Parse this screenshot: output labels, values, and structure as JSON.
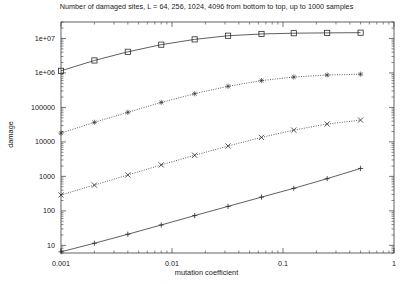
{
  "chart_data": {
    "type": "line",
    "title": "Number of damaged sites, L = 64, 256, 1024, 4096 from bottom to top, up to 1000 samples",
    "xlabel": "mutation coefficient",
    "ylabel": "damage",
    "xscale": "log",
    "yscale": "log",
    "xlim": [
      0.001,
      1.0
    ],
    "ylim": [
      6,
      30000000
    ],
    "grid": false,
    "legend": "none",
    "xticks": [
      0.001,
      0.01,
      0.1,
      1
    ],
    "xtick_labels": [
      "0.001",
      "0.01",
      "0.1",
      "1"
    ],
    "yticks": [
      10,
      100,
      1000,
      10000,
      100000,
      1000000,
      10000000
    ],
    "ytick_labels": [
      "10",
      "100",
      "1000",
      "10000",
      "100000",
      "1e+06",
      "1e+07"
    ],
    "series": [
      {
        "name": "L = 4096",
        "marker": "square-open",
        "linestyle": "solid",
        "x": [
          0.001,
          0.002,
          0.004,
          0.008,
          0.016,
          0.032,
          0.064,
          0.125,
          0.25,
          0.5
        ],
        "y": [
          1150000,
          2300000,
          4100000,
          6600000,
          9400000,
          12000000,
          13500000,
          14200000,
          14500000,
          14700000
        ]
      },
      {
        "name": "L = 1024",
        "marker": "star",
        "linestyle": "dotted",
        "x": [
          0.001,
          0.002,
          0.004,
          0.008,
          0.016,
          0.032,
          0.064,
          0.125,
          0.25,
          0.5
        ],
        "y": [
          18000,
          37000,
          72000,
          140000,
          250000,
          410000,
          600000,
          760000,
          870000,
          920000
        ]
      },
      {
        "name": "L = 256",
        "marker": "cross",
        "linestyle": "dotted",
        "x": [
          0.001,
          0.002,
          0.004,
          0.008,
          0.016,
          0.032,
          0.064,
          0.125,
          0.25,
          0.5
        ],
        "y": [
          290,
          560,
          1100,
          2150,
          4100,
          7600,
          13500,
          22000,
          33000,
          43000
        ]
      },
      {
        "name": "L = 64",
        "marker": "plus",
        "linestyle": "solid",
        "x": [
          0.001,
          0.002,
          0.004,
          0.008,
          0.016,
          0.032,
          0.064,
          0.125,
          0.25,
          0.5
        ],
        "y": [
          6.5,
          11.5,
          21,
          39,
          73,
          135,
          250,
          450,
          860,
          1700
        ]
      }
    ]
  },
  "axis": {
    "ylabel": "damage",
    "xlabel": "mutation coefficient"
  }
}
